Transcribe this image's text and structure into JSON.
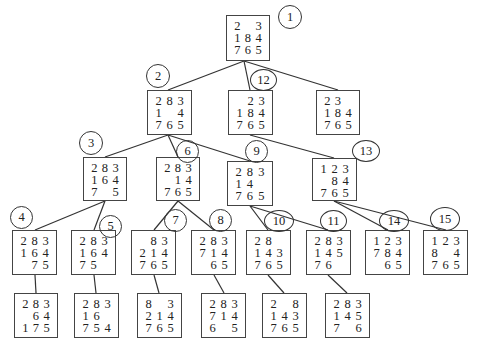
{
  "diagram": {
    "nodes": [
      {
        "id": "root",
        "order": "1",
        "tiles": [
          "2",
          "",
          "3",
          "1",
          "8",
          "4",
          "7",
          "6",
          "5"
        ]
      },
      {
        "id": "n2",
        "order": "2",
        "tiles": [
          "2",
          "8",
          "3",
          "1",
          "",
          "4",
          "7",
          "6",
          "5"
        ]
      },
      {
        "id": "n12",
        "order": "12",
        "tiles": [
          "",
          "2",
          "3",
          "1",
          "8",
          "4",
          "7",
          "6",
          "5"
        ]
      },
      {
        "id": "nR",
        "order": "",
        "tiles": [
          "2",
          "3",
          "",
          "1",
          "8",
          "4",
          "7",
          "6",
          "5"
        ]
      },
      {
        "id": "n3",
        "order": "3",
        "tiles": [
          "2",
          "8",
          "3",
          "1",
          "6",
          "4",
          "7",
          "",
          "5"
        ]
      },
      {
        "id": "n6",
        "order": "6",
        "tiles": [
          "2",
          "8",
          "3",
          "",
          "1",
          "4",
          "7",
          "6",
          "5"
        ]
      },
      {
        "id": "n9",
        "order": "9",
        "tiles": [
          "2",
          "8",
          "3",
          "1",
          "4",
          "",
          "7",
          "6",
          "5"
        ]
      },
      {
        "id": "n13",
        "order": "13",
        "tiles": [
          "1",
          "2",
          "3",
          "",
          "8",
          "4",
          "7",
          "6",
          "5"
        ]
      },
      {
        "id": "n4",
        "order": "4",
        "tiles": [
          "2",
          "8",
          "3",
          "1",
          "6",
          "4",
          "",
          "7",
          "5"
        ]
      },
      {
        "id": "n5",
        "order": "5",
        "tiles": [
          "2",
          "8",
          "3",
          "1",
          "6",
          "4",
          "7",
          "5",
          ""
        ]
      },
      {
        "id": "n7",
        "order": "7",
        "tiles": [
          "",
          "8",
          "3",
          "2",
          "1",
          "4",
          "7",
          "6",
          "5"
        ]
      },
      {
        "id": "n8",
        "order": "8",
        "tiles": [
          "2",
          "8",
          "3",
          "7",
          "1",
          "4",
          "",
          "6",
          "5"
        ]
      },
      {
        "id": "n10",
        "order": "10",
        "tiles": [
          "2",
          "8",
          "",
          "1",
          "4",
          "3",
          "7",
          "6",
          "5"
        ]
      },
      {
        "id": "n11",
        "order": "11",
        "tiles": [
          "2",
          "8",
          "3",
          "1",
          "4",
          "5",
          "7",
          "6",
          ""
        ]
      },
      {
        "id": "n14",
        "order": "14",
        "tiles": [
          "1",
          "2",
          "3",
          "7",
          "8",
          "4",
          "",
          "6",
          "5"
        ]
      },
      {
        "id": "n15",
        "order": "15",
        "tiles": [
          "1",
          "2",
          "3",
          "8",
          "",
          "4",
          "7",
          "6",
          "5"
        ]
      },
      {
        "id": "l4",
        "order": "",
        "tiles": [
          "2",
          "8",
          "3",
          "",
          "6",
          "4",
          "1",
          "7",
          "5"
        ]
      },
      {
        "id": "l5",
        "order": "",
        "tiles": [
          "2",
          "8",
          "3",
          "1",
          "6",
          "",
          "7",
          "5",
          "4"
        ]
      },
      {
        "id": "l7",
        "order": "",
        "tiles": [
          "8",
          "",
          "3",
          "2",
          "1",
          "4",
          "7",
          "6",
          "5"
        ]
      },
      {
        "id": "l8",
        "order": "",
        "tiles": [
          "2",
          "8",
          "3",
          "7",
          "1",
          "4",
          "6",
          "",
          "5"
        ]
      },
      {
        "id": "l10",
        "order": "",
        "tiles": [
          "2",
          "",
          "8",
          "1",
          "4",
          "3",
          "7",
          "6",
          "5"
        ]
      },
      {
        "id": "l11",
        "order": "",
        "tiles": [
          "2",
          "8",
          "3",
          "1",
          "4",
          "5",
          "7",
          "",
          "6"
        ]
      }
    ]
  }
}
